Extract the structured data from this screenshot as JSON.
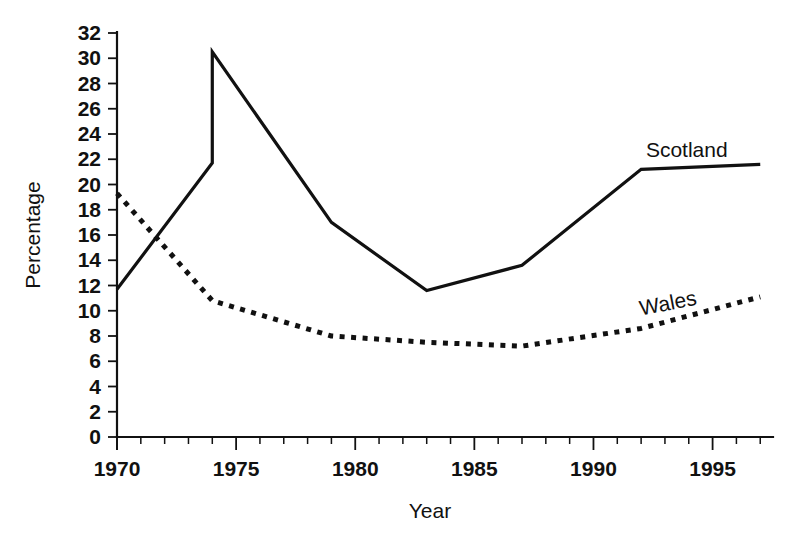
{
  "chart_data": {
    "type": "line",
    "title": "",
    "xlabel": "Year",
    "ylabel": "Percentage",
    "xlim": [
      1970,
      1997.2
    ],
    "ylim": [
      0,
      32
    ],
    "grid": false,
    "legend_position": "inline-right",
    "x_ticks_major": [
      1970,
      1975,
      1980,
      1985,
      1990,
      1995
    ],
    "x_tick_labels": [
      "1970",
      "1975",
      "1980",
      "1985",
      "1990",
      "1995"
    ],
    "x_minor_tick_step": 1,
    "y_ticks": [
      0,
      2,
      4,
      6,
      8,
      10,
      12,
      14,
      16,
      18,
      20,
      22,
      24,
      26,
      28,
      30,
      32
    ],
    "y_tick_labels": [
      "0",
      "2",
      "4",
      "6",
      "8",
      "10",
      "12",
      "14",
      "16",
      "18",
      "20",
      "22",
      "24",
      "26",
      "28",
      "30",
      "32"
    ],
    "series": [
      {
        "name": "Scotland",
        "style": "solid",
        "color": "#111111",
        "label_text": "Scotland",
        "x": [
          1970,
          1974,
          1974,
          1979,
          1983,
          1987,
          1992,
          1997
        ],
        "values": [
          11.7,
          21.7,
          30.5,
          17.0,
          11.6,
          13.6,
          21.2,
          21.6
        ]
      },
      {
        "name": "Wales",
        "style": "dotted",
        "color": "#111111",
        "label_text": "Wales",
        "x": [
          1970,
          1974,
          1979,
          1983,
          1987,
          1992,
          1997
        ],
        "values": [
          19.3,
          10.8,
          8.0,
          7.5,
          7.2,
          8.6,
          11.1
        ]
      }
    ]
  },
  "labels": {
    "scotland": "Scotland",
    "wales": "Wales",
    "x_axis_title": "Year",
    "y_axis_title": "Percentage"
  }
}
